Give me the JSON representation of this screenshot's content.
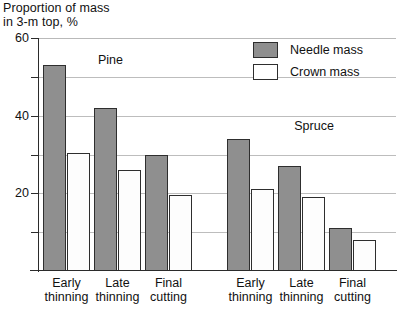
{
  "chart_data": {
    "type": "bar",
    "title": "Proportion of mass\nin 3-m top, %",
    "xlabel": "",
    "ylabel": "Proportion of mass in 3-m top, %",
    "ylim": [
      0,
      60
    ],
    "yticks_major": [
      20,
      40,
      60
    ],
    "yticks_minor": [
      10,
      30,
      50
    ],
    "ytick_labels": [
      "20",
      "40",
      "60"
    ],
    "grid": true,
    "grid_axis": "y",
    "legend_position": "top-right",
    "categories": [
      "Early thinning",
      "Late thinning",
      "Final cutting",
      "Early thinning",
      "Late thinning",
      "Final cutting"
    ],
    "group_annotations": [
      {
        "label": "Pine",
        "left_pct": 16.5,
        "top_px": 53
      },
      {
        "label": "Spruce",
        "left_pct": 71.5,
        "top_px": 119
      }
    ],
    "series": [
      {
        "name": "Needle mass",
        "color": "#8f8f8f",
        "values": [
          53,
          42,
          30,
          34,
          27,
          11
        ]
      },
      {
        "name": "Crown mass",
        "color": "#ffffff",
        "values": [
          30.5,
          26,
          19.5,
          21,
          19,
          8
        ]
      }
    ],
    "groups": [
      {
        "species": "Pine",
        "category": "Early thinning",
        "needle_mass": 53,
        "crown_mass": 30.5
      },
      {
        "species": "Pine",
        "category": "Late thinning",
        "needle_mass": 42,
        "crown_mass": 26
      },
      {
        "species": "Pine",
        "category": "Final cutting",
        "needle_mass": 30,
        "crown_mass": 19.5
      },
      {
        "species": "Spruce",
        "category": "Early thinning",
        "needle_mass": 34,
        "crown_mass": 21
      },
      {
        "species": "Spruce",
        "category": "Late thinning",
        "needle_mass": 27,
        "crown_mass": 19
      },
      {
        "species": "Spruce",
        "category": "Final cutting",
        "needle_mass": 11,
        "crown_mass": 8
      }
    ]
  },
  "legend": {
    "items": [
      {
        "label": "Needle mass",
        "swatch": "filled-gray"
      },
      {
        "label": "Crown mass",
        "swatch": "outline-white"
      }
    ]
  },
  "axis": {
    "title": "Proportion of mass\nin 3-m top, %",
    "ytick_60": "60",
    "ytick_40": "40",
    "ytick_20": "20"
  },
  "xlabels": [
    "Early\nthinning",
    "Late\nthinning",
    "Final\ncutting",
    "Early\nthinning",
    "Late\nthinning",
    "Final\ncutting"
  ],
  "annotations": {
    "pine": "Pine",
    "spruce": "Spruce"
  }
}
